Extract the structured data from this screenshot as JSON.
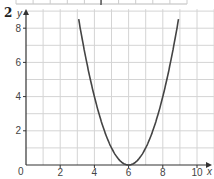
{
  "question_number": "2",
  "chart_data": {
    "type": "line",
    "title": "",
    "xlabel": "x",
    "ylabel": "y",
    "xlim": [
      0,
      11
    ],
    "ylim": [
      0,
      9
    ],
    "x_ticks": [
      0,
      2,
      4,
      6,
      8,
      10
    ],
    "y_ticks": [
      2,
      4,
      6,
      8
    ],
    "origin_label": "0",
    "grid": true,
    "grid_step": 1,
    "series": [
      {
        "name": "y = (x - 6)^2",
        "x": [
          3.0,
          3.5,
          4,
          4.5,
          5,
          5.5,
          6,
          6.5,
          7,
          7.5,
          8,
          8.5,
          9.0
        ],
        "values": [
          9,
          6.25,
          4,
          2.25,
          1,
          0.25,
          0,
          0.25,
          1,
          2.25,
          4,
          6.25,
          9
        ]
      }
    ],
    "annotations": [
      "vertex at (6, 0)"
    ]
  },
  "colors": {
    "grid": "#d4d4d4",
    "axis": "#333333",
    "curve": "#444444"
  }
}
